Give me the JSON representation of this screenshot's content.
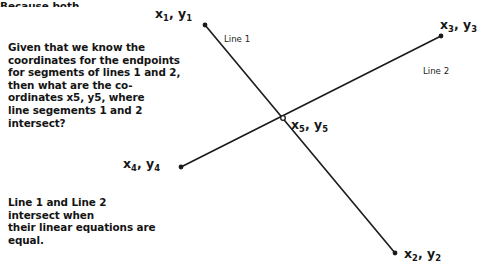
{
  "page": {
    "background_color": "#ffffff",
    "width": 488,
    "height": 273
  },
  "text_blocks": {
    "question": "Given that we know the\ncoordinates for the endpoints\nfor segments of lines 1 and 2,\nthen what are the co-\nordinates x5, y5, where\nline segements 1 and 2\nintersect?",
    "explanation": "Line 1 and Line 2\nintersect when\ntheir linear equations are\nequal.",
    "clipped_bottom": "Because both"
  },
  "labels": {
    "point1": {
      "x": "x",
      "sub1": "1",
      "sep": ", y",
      "sub2": "1"
    },
    "point2": {
      "x": "x",
      "sub1": "2",
      "sep": ", y",
      "sub2": "2"
    },
    "point3": {
      "x": "x",
      "sub1": "3",
      "sep": ", y",
      "sub2": "3"
    },
    "point4": {
      "x": "x",
      "sub1": "4",
      "sep": ", y",
      "sub2": "4"
    },
    "point5": {
      "x": "x",
      "sub1": "5",
      "sep": ", y",
      "sub2": "5"
    },
    "line1": "Line 1",
    "line2": "Line 2"
  },
  "chart_data": {
    "type": "scatter",
    "title": "",
    "xlabel": "",
    "ylabel": "",
    "grid": false,
    "legend": "none",
    "stroke_color": "#1a1a1a",
    "stroke_width": 1.6,
    "point_color": "#1a1a1a",
    "point_radius": 2.4,
    "segments": [
      {
        "name": "Line 1",
        "label": "Line 1",
        "start": {
          "name": "x1, y1",
          "px": 205,
          "py": 25
        },
        "end": {
          "name": "x2, y2",
          "px": 395,
          "py": 253
        },
        "label_px": 224,
        "label_py": 34
      },
      {
        "name": "Line 2",
        "label": "Line 2",
        "start": {
          "name": "x4, y4",
          "px": 181,
          "py": 167
        },
        "end": {
          "name": "x3, y3",
          "px": 441,
          "py": 36
        },
        "label_px": 423,
        "label_py": 66
      }
    ],
    "intersection": {
      "name": "x5, y5",
      "px": 283,
      "py": 118
    },
    "endpoints": [
      {
        "name": "x1, y1",
        "px": 205,
        "py": 25
      },
      {
        "name": "x2, y2",
        "px": 395,
        "py": 253
      },
      {
        "name": "x3, y3",
        "px": 441,
        "py": 36
      },
      {
        "name": "x4, y4",
        "px": 181,
        "py": 167
      }
    ]
  }
}
